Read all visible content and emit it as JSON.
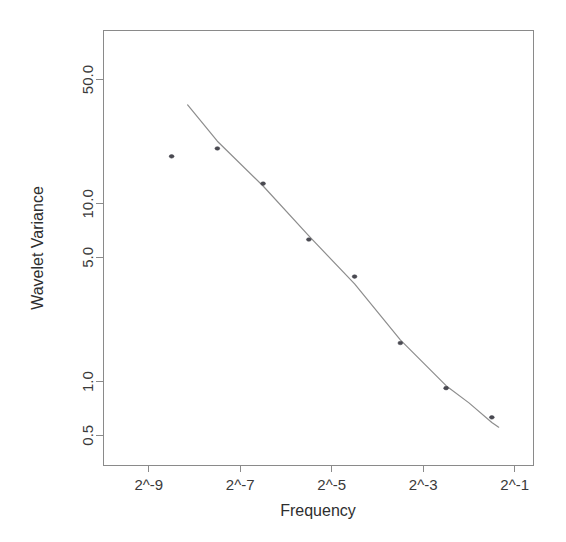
{
  "chart_data": {
    "type": "scatter",
    "title": "",
    "xlabel": "Frequency",
    "ylabel": "Wavelet Variance",
    "xscale": "log2",
    "yscale": "log",
    "grid": false,
    "legend": null,
    "box_border": true,
    "xticks": [
      {
        "label": "2^-9",
        "value": -9
      },
      {
        "label": "2^-7",
        "value": -7
      },
      {
        "label": "2^-5",
        "value": -5
      },
      {
        "label": "2^-3",
        "value": -3
      },
      {
        "label": "2^-1",
        "value": -1
      }
    ],
    "yticks": [
      {
        "label": "50.0",
        "value": 50.0
      },
      {
        "label": "10.0",
        "value": 10.0
      },
      {
        "label": "5.0",
        "value": 5.0
      },
      {
        "label": "1.0",
        "value": 1.0
      },
      {
        "label": "0.5",
        "value": 0.5
      }
    ],
    "xlim": [
      -10.0,
      -0.6
    ],
    "ylim": [
      0.34,
      95.0
    ],
    "x": [
      -8.5,
      -7.5,
      -6.5,
      -5.5,
      -4.5,
      -3.5,
      -2.5,
      -1.5
    ],
    "values": [
      18.5,
      20.5,
      13.0,
      6.3,
      3.9,
      1.65,
      0.92,
      0.63
    ],
    "series": [
      {
        "name": "Wavelet Variance",
        "marker": "point",
        "x": [
          -8.5,
          -7.5,
          -6.5,
          -5.5,
          -4.5,
          -3.5,
          -2.5,
          -1.5
        ],
        "values": [
          18.5,
          20.5,
          13.0,
          6.3,
          3.9,
          1.65,
          0.92,
          0.63
        ]
      },
      {
        "name": "fitted-curve",
        "marker": "none",
        "line": true,
        "x": [
          -8.15,
          -7.5,
          -6.5,
          -5.5,
          -4.5,
          -3.5,
          -2.5,
          -2.0,
          -1.5,
          -1.35
        ],
        "values": [
          36.0,
          22.5,
          12.6,
          6.6,
          3.55,
          1.72,
          0.95,
          0.76,
          0.59,
          0.555
        ]
      }
    ],
    "colors": {
      "line": "#8d8d8d",
      "marker": "#4a4a52",
      "axis": "#8a8a8a",
      "text": "#3a3a3a",
      "background": "#ffffff"
    }
  },
  "plot_area": {
    "left": 103,
    "right": 533,
    "top": 30,
    "bottom": 465
  }
}
